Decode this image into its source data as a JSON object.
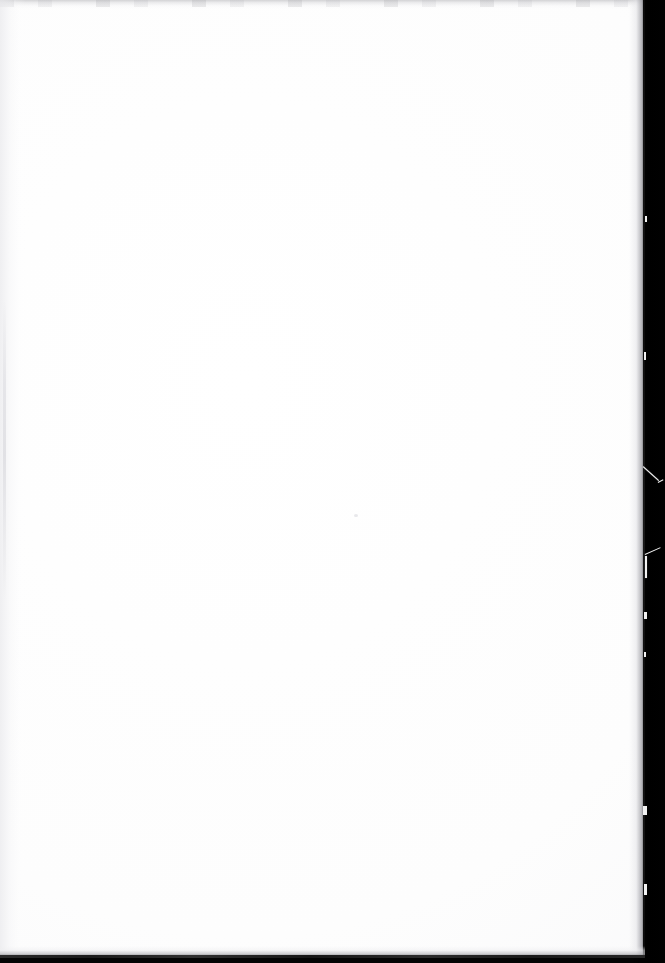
{
  "document": {
    "kind": "scanned-page-image",
    "page_content": "",
    "page_content_note": "blank page — no printed text, headings, figures, folios or running heads are visible",
    "visible_text_count": "0"
  },
  "scan": {
    "width": "665",
    "height": "963",
    "page_background_color": "#ffffff",
    "scanner_background_color": "#030303",
    "edge_shadow_color": "#1a1a1a",
    "artifact_color": "#f2f2f2"
  },
  "regions": {
    "page_leaf": "blank white paper leaf",
    "scanner_backdrop": "black scanner platen background at right",
    "top_band": "faint gray scan banding along top edge",
    "left_gutter": "faint gray tone along left binding margin",
    "fore_edge": "dark ragged right fore-edge of the sheet",
    "tail_edge": "dark shadow line along bottom edge"
  },
  "artifacts": {
    "fibre_diagonal_upper": "thin white fibre streak on dark backdrop",
    "fibre_hook": "small white hair/fibre caught at the fore-edge",
    "edge_nicks": "small pale nicks along the torn fore-edge",
    "paper_fleck": "faint speck of residue on the blank sheet"
  }
}
